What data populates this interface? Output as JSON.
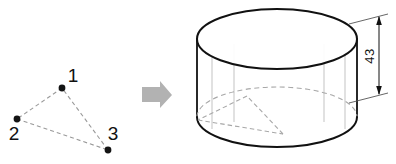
{
  "figure": {
    "background_color": "#ffffff",
    "width": 396,
    "height": 164
  },
  "left_panel": {
    "name": "point-triangle",
    "description": "Three labeled points connected by dashed lines forming a triangle",
    "point_color": "#141414",
    "edge_color": "#9a9a9a",
    "edge_style": "dashed",
    "points": [
      {
        "id": "1",
        "label": "1",
        "x": 62,
        "y": 88,
        "label_x": 73,
        "label_y": 82
      },
      {
        "id": "2",
        "label": "2",
        "x": 17,
        "y": 119,
        "label_x": 12,
        "label_y": 140
      },
      {
        "id": "3",
        "label": "3",
        "x": 108,
        "y": 150,
        "label_x": 110,
        "label_y": 140
      }
    ],
    "edges": [
      {
        "from": "1",
        "to": "2"
      },
      {
        "from": "2",
        "to": "3"
      },
      {
        "from": "3",
        "to": "1"
      }
    ]
  },
  "transition": {
    "name": "right-arrow",
    "label": "",
    "color": "#b0b0b0",
    "direction": "right"
  },
  "right_panel": {
    "name": "cylinder",
    "description": "3D cylinder with inscribed dashed triangle on its base and a height dimension",
    "outline_color": "#111111",
    "hidden_line_color": "#a8a8a8",
    "ruling_line_color": "#b5b5b5",
    "top_ellipse": {
      "cx": 277,
      "cy": 39,
      "rx": 80,
      "ry": 30
    },
    "bottom_ellipse": {
      "cx": 277,
      "cy": 117,
      "rx": 80,
      "ry": 30
    },
    "inscribed_triangle": [
      {
        "id": "1",
        "x": 247,
        "y": 96
      },
      {
        "id": "2",
        "x": 198,
        "y": 120
      },
      {
        "id": "3",
        "x": 283,
        "y": 134
      }
    ],
    "ruling_lines_x": [
      212,
      234,
      324,
      345
    ],
    "dimension": {
      "name": "height-dimension",
      "value": "43",
      "orientation": "vertical",
      "text_x": 374,
      "text_y": 56,
      "line_x": 379,
      "top_y": 16,
      "bottom_y": 95
    }
  }
}
